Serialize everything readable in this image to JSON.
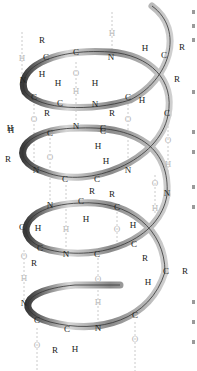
{
  "diagram": {
    "title": "",
    "colors": {
      "ribbon_dark": "#3a3a3a",
      "ribbon_light": "#d0d0d0",
      "label": "#222222",
      "hbond": "#b8b8b8"
    },
    "labels": [
      {
        "t": "H",
        "x": 22,
        "y": 58,
        "c": "light"
      },
      {
        "t": "R",
        "x": 42,
        "y": 40
      },
      {
        "t": "C",
        "x": 46,
        "y": 57
      },
      {
        "t": "H",
        "x": 42,
        "y": 74
      },
      {
        "t": "C",
        "x": 76,
        "y": 52
      },
      {
        "t": "N",
        "x": 111,
        "y": 57
      },
      {
        "t": "H",
        "x": 112,
        "y": 33,
        "c": "light"
      },
      {
        "t": "H",
        "x": 145,
        "y": 48
      },
      {
        "t": "C",
        "x": 164,
        "y": 55
      },
      {
        "t": "R",
        "x": 182,
        "y": 47
      },
      {
        "t": "N",
        "x": 23,
        "y": 80
      },
      {
        "t": "H",
        "x": 58,
        "y": 83
      },
      {
        "t": "H",
        "x": 95,
        "y": 83
      },
      {
        "t": "C",
        "x": 34,
        "y": 97
      },
      {
        "t": "C",
        "x": 60,
        "y": 103
      },
      {
        "t": "N",
        "x": 95,
        "y": 104
      },
      {
        "t": "C",
        "x": 128,
        "y": 97
      },
      {
        "t": "R",
        "x": 177,
        "y": 79
      },
      {
        "t": "H",
        "x": 142,
        "y": 100
      },
      {
        "t": "R",
        "x": 47,
        "y": 113
      },
      {
        "t": "O",
        "x": 76,
        "y": 73,
        "c": "light"
      },
      {
        "t": "H",
        "x": 76,
        "y": 91,
        "c": "light"
      },
      {
        "t": "O",
        "x": 34,
        "y": 119,
        "c": "light"
      },
      {
        "t": "O",
        "x": 128,
        "y": 119,
        "c": "light"
      },
      {
        "t": "R",
        "x": 112,
        "y": 113
      },
      {
        "t": "C",
        "x": 167,
        "y": 113
      },
      {
        "t": "H",
        "x": 10,
        "y": 128
      },
      {
        "t": "N",
        "x": 76,
        "y": 126
      },
      {
        "t": "C",
        "x": 103,
        "y": 128
      },
      {
        "t": "H",
        "x": 11,
        "y": 130
      },
      {
        "t": "C",
        "x": 50,
        "y": 133
      },
      {
        "t": "C",
        "x": 103,
        "y": 131
      },
      {
        "t": "R",
        "x": 8,
        "y": 159
      },
      {
        "t": "H",
        "x": 98,
        "y": 146
      },
      {
        "t": "O",
        "x": 168,
        "y": 140,
        "c": "light"
      },
      {
        "t": "O",
        "x": 50,
        "y": 157,
        "c": "light"
      },
      {
        "t": "H",
        "x": 106,
        "y": 161
      },
      {
        "t": "N",
        "x": 36,
        "y": 170
      },
      {
        "t": "C",
        "x": 65,
        "y": 179
      },
      {
        "t": "C",
        "x": 97,
        "y": 179
      },
      {
        "t": "N",
        "x": 128,
        "y": 170
      },
      {
        "t": "H",
        "x": 168,
        "y": 164,
        "c": "light"
      },
      {
        "t": "O",
        "x": 155,
        "y": 183,
        "c": "light"
      },
      {
        "t": "R",
        "x": 92,
        "y": 191
      },
      {
        "t": "R",
        "x": 112,
        "y": 194
      },
      {
        "t": "N",
        "x": 167,
        "y": 193
      },
      {
        "t": "N",
        "x": 50,
        "y": 205
      },
      {
        "t": "C",
        "x": 81,
        "y": 201
      },
      {
        "t": "C",
        "x": 117,
        "y": 207
      },
      {
        "t": "H",
        "x": 155,
        "y": 208,
        "c": "light"
      },
      {
        "t": "H",
        "x": 86,
        "y": 219
      },
      {
        "t": "C",
        "x": 22,
        "y": 227
      },
      {
        "t": "H",
        "x": 38,
        "y": 228
      },
      {
        "t": "H",
        "x": 66,
        "y": 229,
        "c": "light"
      },
      {
        "t": "O",
        "x": 117,
        "y": 229,
        "c": "light"
      },
      {
        "t": "H",
        "x": 133,
        "y": 225
      },
      {
        "t": "C",
        "x": 40,
        "y": 248
      },
      {
        "t": "N",
        "x": 66,
        "y": 254
      },
      {
        "t": "C",
        "x": 97,
        "y": 254
      },
      {
        "t": "C",
        "x": 134,
        "y": 244
      },
      {
        "t": "R",
        "x": 34,
        "y": 263
      },
      {
        "t": "R",
        "x": 145,
        "y": 258
      },
      {
        "t": "O",
        "x": 24,
        "y": 256,
        "c": "light"
      },
      {
        "t": "H",
        "x": 24,
        "y": 278,
        "c": "light"
      },
      {
        "t": "C",
        "x": 166,
        "y": 271
      },
      {
        "t": "R",
        "x": 185,
        "y": 271
      },
      {
        "t": "H",
        "x": 148,
        "y": 282
      },
      {
        "t": "O",
        "x": 98,
        "y": 279,
        "c": "light"
      },
      {
        "t": "H",
        "x": 98,
        "y": 302,
        "c": "light"
      },
      {
        "t": "N",
        "x": 24,
        "y": 303
      },
      {
        "t": "C",
        "x": 37,
        "y": 320
      },
      {
        "t": "C",
        "x": 135,
        "y": 315
      },
      {
        "t": "C",
        "x": 67,
        "y": 329
      },
      {
        "t": "N",
        "x": 98,
        "y": 328
      },
      {
        "t": "O",
        "x": 37,
        "y": 345,
        "c": "light"
      },
      {
        "t": "O",
        "x": 135,
        "y": 339,
        "c": "light"
      },
      {
        "t": "R",
        "x": 55,
        "y": 350
      },
      {
        "t": "H",
        "x": 75,
        "y": 349
      }
    ]
  }
}
